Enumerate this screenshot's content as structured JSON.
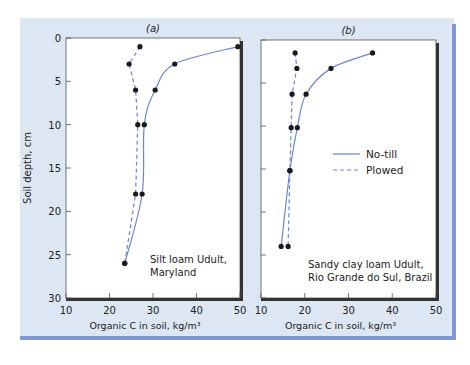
{
  "figure": {
    "background_color": "#dde6f3",
    "accent_bar_color": "#8297d8",
    "line_color": "#6c86d4",
    "marker_color": "#1a1a1a"
  },
  "axes": {
    "ylabel": "Soil depth, cm",
    "xlabel": "Organic C in soil, kg/m³",
    "y_ticks": [
      "0",
      "5",
      "10",
      "15",
      "20",
      "25",
      "30"
    ],
    "x_ticks": [
      "10",
      "20",
      "30",
      "40",
      "50"
    ]
  },
  "legend": {
    "no_till": "No-till",
    "plowed": "Plowed"
  },
  "chart_data": [
    {
      "type": "line",
      "panel": "(a)",
      "title": "(a)",
      "annotation": [
        "Silt loam Udult,",
        "Maryland"
      ],
      "xlabel": "Organic C in soil, kg/m³",
      "ylabel": "Soil depth, cm",
      "xlim": [
        10,
        50
      ],
      "ylim": [
        30,
        0
      ],
      "y_inverted": true,
      "grid": false,
      "series": [
        {
          "name": "No-till",
          "style": "solid",
          "points": [
            [
              49.5,
              1
            ],
            [
              35,
              3
            ],
            [
              30.5,
              6
            ],
            [
              28,
              10
            ],
            [
              27.5,
              18
            ],
            [
              23.5,
              26
            ]
          ]
        },
        {
          "name": "Plowed",
          "style": "dashed",
          "points": [
            [
              27,
              1
            ],
            [
              24.5,
              3
            ],
            [
              26,
              6
            ],
            [
              26.5,
              10
            ],
            [
              26,
              18
            ],
            [
              23.5,
              26
            ]
          ]
        }
      ]
    },
    {
      "type": "line",
      "panel": "(b)",
      "title": "(b)",
      "annotation": [
        "Sandy clay loam Udult,",
        "Rio Grande do Sul, Brazil"
      ],
      "xlabel": "Organic C in soil, kg/m³",
      "ylabel": "Soil depth, cm",
      "xlim": [
        10,
        50
      ],
      "ylim": [
        30,
        0
      ],
      "y_inverted": true,
      "grid": false,
      "legend": [
        "No-till",
        "Plowed"
      ],
      "legend_position": "right-middle",
      "series": [
        {
          "name": "No-till",
          "style": "solid",
          "points": [
            [
              35.5,
              1.5
            ],
            [
              26,
              3.3
            ],
            [
              20.3,
              6.3
            ],
            [
              18.3,
              10.2
            ],
            [
              16.6,
              15.2
            ],
            [
              14.6,
              24
            ]
          ]
        },
        {
          "name": "Plowed",
          "style": "dashed",
          "points": [
            [
              17.8,
              1.5
            ],
            [
              18.2,
              3.3
            ],
            [
              17.1,
              6.3
            ],
            [
              16.9,
              10.2
            ],
            [
              16.6,
              15.2
            ],
            [
              16.2,
              24
            ]
          ]
        }
      ]
    }
  ]
}
